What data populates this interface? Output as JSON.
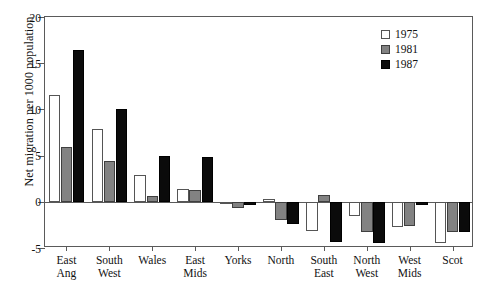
{
  "chart_data": {
    "type": "bar",
    "title": "",
    "xlabel": "",
    "ylabel": "Net migration per 1000 population",
    "ylim": [
      -5,
      20
    ],
    "yticks": [
      -5,
      0,
      5,
      10,
      15,
      20
    ],
    "ytick_labels": [
      "-5",
      "0",
      "5",
      "10",
      "15",
      "20"
    ],
    "grid": false,
    "legend_position": "top-right",
    "categories": [
      "East\nAng",
      "South\nWest",
      "Wales",
      "East\nMids",
      "Yorks",
      "North",
      "South\nEast",
      "North\nWest",
      "West\nMids",
      "Scot"
    ],
    "series": [
      {
        "name": "1975",
        "color": "#ffffff",
        "values": [
          11.6,
          7.9,
          2.9,
          1.4,
          0.0,
          0.3,
          -3.2,
          -1.5,
          -2.7,
          -4.5
        ]
      },
      {
        "name": "1981",
        "color": "#828282",
        "values": [
          5.9,
          4.4,
          0.6,
          1.3,
          -0.7,
          -2.0,
          0.7,
          -3.3,
          -2.6,
          -3.3
        ]
      },
      {
        "name": "1987",
        "color": "#0b0b0b",
        "values": [
          16.4,
          10.0,
          5.0,
          4.8,
          -0.4,
          -2.4,
          -4.3,
          -4.5,
          -0.3,
          -3.3
        ]
      }
    ]
  }
}
